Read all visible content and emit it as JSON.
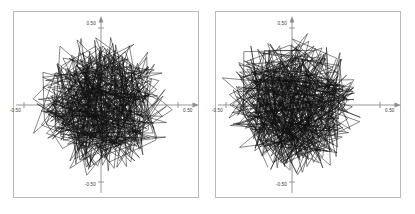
{
  "figure": {
    "background_color": "#ffffff",
    "width": 415,
    "height": 214,
    "panel_count": 2
  },
  "panels": [
    {
      "name": "left-plot",
      "frame": {
        "x": 13,
        "y": 11,
        "width": 185,
        "height": 186
      },
      "origin": {
        "x": 101,
        "y": 105
      },
      "axis_color": "#8d8d8d",
      "frame_color": "#b9b9b9",
      "curve_color": "#101010",
      "labels": {
        "y_top": "0.50",
        "y_bottom": "-0.50",
        "x_left": "-0.50",
        "x_right": "0.50"
      }
    },
    {
      "name": "right-plot",
      "frame": {
        "x": 7,
        "y": 11,
        "width": 185,
        "height": 186
      },
      "origin": {
        "x": 84,
        "y": 105
      },
      "axis_color": "#8d8d8d",
      "frame_color": "#b9b9b9",
      "curve_color": "#101010",
      "labels": {
        "y_top": "0.50",
        "y_bottom": "-0.50",
        "x_left": "-0.50",
        "x_right": "0.50"
      }
    }
  ],
  "chart_data": {
    "type": "line",
    "title": "",
    "subtitle": "",
    "xlabel": "",
    "ylabel": "",
    "grid": false,
    "legend": "none",
    "xlim": [
      -0.6,
      0.6
    ],
    "ylim": [
      -0.6,
      0.6
    ],
    "xticks": [
      -0.5,
      0.5
    ],
    "yticks": [
      -0.5,
      0.5
    ],
    "xtick_labels": [
      "-0.50",
      "0.50"
    ],
    "ytick_labels": [
      "-0.50",
      "0.50"
    ],
    "series": [
      {
        "name": "trajectory-left",
        "panel": "left-plot",
        "segment_count": 420,
        "radius_mean": 0.3,
        "radius_max": 0.47,
        "seed": 1771
      },
      {
        "name": "trajectory-right",
        "panel": "right-plot",
        "segment_count": 430,
        "radius_mean": 0.3,
        "radius_max": 0.47,
        "seed": 99371
      }
    ]
  }
}
